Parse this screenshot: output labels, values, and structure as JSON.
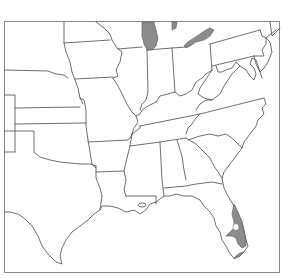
{
  "map": {
    "type": "range-distribution-map",
    "region": "Central and Eastern United States",
    "colors": {
      "background": "#ffffff",
      "frame": "#8a8a8a",
      "border": "#4a4a4a",
      "range_fill": "#8c8c8c"
    },
    "shaded_areas": [
      {
        "name": "Lake Michigan",
        "label": ""
      },
      {
        "name": "Lake Erie",
        "label": ""
      },
      {
        "name": "South Florida",
        "label": ""
      }
    ],
    "states_shown": [
      "Nebraska",
      "Kansas",
      "Oklahoma",
      "Texas",
      "Iowa",
      "Missouri",
      "Arkansas",
      "Louisiana",
      "Illinois",
      "Indiana",
      "Ohio",
      "Kentucky",
      "Tennessee",
      "Mississippi",
      "Alabama",
      "Georgia",
      "Florida",
      "South Carolina",
      "North Carolina",
      "Virginia",
      "West Virginia",
      "Pennsylvania",
      "New Jersey",
      "Maryland",
      "Delaware",
      "Michigan",
      "Colorado",
      "New Mexico"
    ]
  }
}
